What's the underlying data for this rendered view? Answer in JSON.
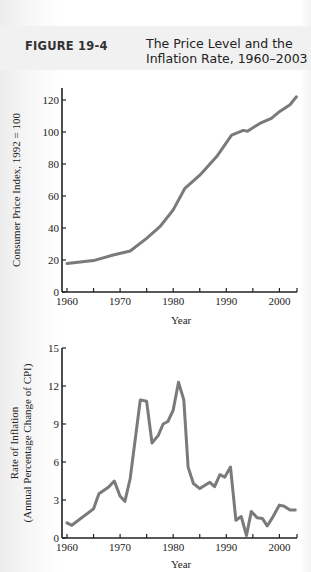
{
  "figure": {
    "label": "FIGURE 19-4",
    "title_line1": "The Price Level and the",
    "title_line2": "Inflation Rate, 1960–2003"
  },
  "colors": {
    "line": "#7a7a7a",
    "axis": "#222222",
    "background": "#ffffff"
  },
  "chart_data": [
    {
      "type": "line",
      "title": "Consumer Price Index",
      "xlabel": "Year",
      "ylabel": "Consumer Price Index, 1992 = 100",
      "xlim": [
        1960,
        2003
      ],
      "ylim": [
        0,
        130
      ],
      "x_ticks": [
        1960,
        1970,
        1980,
        1990,
        2000
      ],
      "y_ticks": [
        0,
        20,
        40,
        60,
        80,
        100,
        120
      ],
      "grid": false,
      "series": [
        {
          "name": "CPI",
          "x": [
            1960,
            1965,
            1968.7,
            1971.9,
            1975,
            1977.5,
            1980,
            1982.2,
            1985,
            1988.2,
            1991,
            1993.2,
            1994,
            1996.3,
            1998.5,
            2000,
            2002,
            2003.2
          ],
          "values": [
            17.9,
            19.6,
            23.1,
            25.6,
            33.5,
            40.8,
            51.3,
            64.8,
            73,
            84.6,
            98,
            101,
            100.5,
            105.4,
            108.5,
            112.7,
            117,
            122
          ]
        }
      ]
    },
    {
      "type": "line",
      "title": "Rate of Inflation",
      "xlabel": "Year",
      "ylabel": "Rate of Inflation (Annual Percentage Change of CPI)",
      "xlim": [
        1960,
        2003
      ],
      "ylim": [
        0,
        15
      ],
      "x_ticks": [
        1960,
        1970,
        1980,
        1990,
        2000
      ],
      "y_ticks": [
        0,
        3,
        6,
        9,
        12,
        15
      ],
      "grid": false,
      "series": [
        {
          "name": "Inflation rate",
          "x": [
            1960,
            1960.9,
            1965,
            1966,
            1967.8,
            1968.9,
            1970,
            1970.9,
            1971.9,
            1973.8,
            1975,
            1976,
            1977.2,
            1978.1,
            1979,
            1980,
            1981,
            1982,
            1982.8,
            1983.8,
            1985,
            1986.9,
            1987.8,
            1988.8,
            1989.7,
            1990.8,
            1991.8,
            1992.8,
            1993.8,
            1994.7,
            1995.8,
            1996.8,
            1997.7,
            1998.6,
            2000,
            2000.9,
            2002,
            2003
          ],
          "values": [
            1.2,
            1.0,
            2.3,
            3.5,
            4.0,
            4.5,
            3.3,
            2.9,
            4.7,
            10.9,
            10.8,
            7.5,
            8.1,
            9.0,
            9.2,
            10.1,
            12.3,
            10.9,
            5.6,
            4.3,
            3.9,
            4.4,
            4.05,
            5.0,
            4.8,
            5.6,
            1.4,
            1.7,
            0.2,
            2.1,
            1.6,
            1.55,
            0.95,
            1.55,
            2.6,
            2.5,
            2.2,
            2.2
          ]
        }
      ]
    }
  ]
}
